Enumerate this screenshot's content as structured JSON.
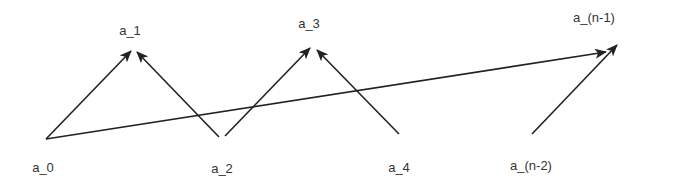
{
  "diagram": {
    "type": "directed-graph",
    "line_color": "#222222",
    "label_color": "#333333",
    "nodes": [
      {
        "id": "a0",
        "label": "a_0",
        "x": 43,
        "y": 167
      },
      {
        "id": "a1",
        "label": "a_1",
        "x": 130,
        "y": 30
      },
      {
        "id": "a2",
        "label": "a_2",
        "x": 222,
        "y": 168
      },
      {
        "id": "a3",
        "label": "a_3",
        "x": 309,
        "y": 23
      },
      {
        "id": "a4",
        "label": "a_4",
        "x": 399,
        "y": 167
      },
      {
        "id": "an1",
        "label": "a_(n-1)",
        "x": 594,
        "y": 17
      },
      {
        "id": "an2",
        "label": "a_(n-2)",
        "x": 531,
        "y": 165
      }
    ],
    "edges": [
      {
        "from": "a0",
        "to": "a1",
        "x1": 46,
        "y1": 139,
        "x2": 131,
        "y2": 51
      },
      {
        "from": "a0",
        "to": "an1",
        "x1": 46,
        "y1": 139,
        "x2": 606,
        "y2": 52
      },
      {
        "from": "a2",
        "to": "a1",
        "x1": 219,
        "y1": 137,
        "x2": 137,
        "y2": 52
      },
      {
        "from": "a2",
        "to": "a3",
        "x1": 225,
        "y1": 136,
        "x2": 310,
        "y2": 48
      },
      {
        "from": "a4",
        "to": "a3",
        "x1": 399,
        "y1": 134,
        "x2": 317,
        "y2": 50
      },
      {
        "from": "an2",
        "to": "an1",
        "x1": 532,
        "y1": 134,
        "x2": 617,
        "y2": 45
      }
    ]
  }
}
